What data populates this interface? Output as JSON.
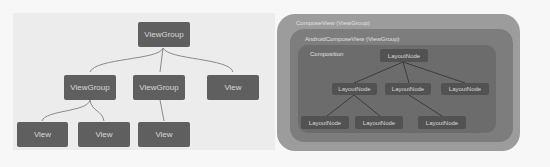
{
  "view_tree": {
    "root": "ViewGroup",
    "level1": [
      "ViewGroup",
      "ViewGroup",
      "View"
    ],
    "level2": [
      "View",
      "View",
      "View"
    ]
  },
  "compose_tree": {
    "outer_label": "ComposeView (ViewGroup)",
    "mid_label": "AndroidComposeView (ViewGroup)",
    "inner_label": "Composition",
    "root": "LayoutNode",
    "level1": [
      "LayoutNode",
      "LayoutNode",
      "LayoutNode"
    ],
    "level2": [
      "LayoutNode",
      "LayoutNode",
      "LayoutNode"
    ]
  }
}
